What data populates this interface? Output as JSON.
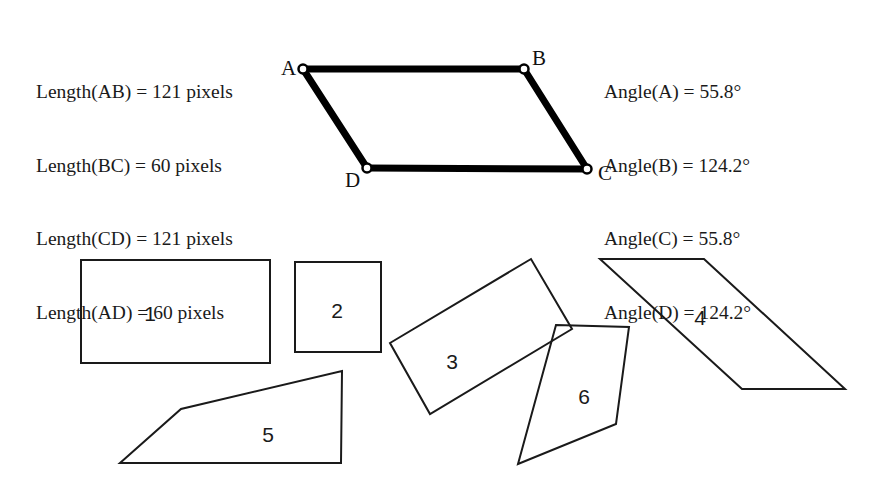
{
  "canvas": {
    "width": 889,
    "height": 497,
    "background": "#ffffff"
  },
  "measurements": {
    "lengths": {
      "lines": [
        "Length(AB) = 121 pixels",
        "Length(BC) = 60 pixels",
        "Length(CD) = 121 pixels",
        "Length(AD) = 60 pixels"
      ]
    },
    "angles": {
      "lines": [
        "Angle(A) = 55.8°",
        "Angle(B) = 124.2°",
        "Angle(C) = 55.8°",
        "Angle(D) = 124.2°"
      ]
    }
  },
  "reference_figure": {
    "name": "parallelogram-ABCD",
    "stroke_color": "#000000",
    "stroke_width": 7,
    "vertex_marker": {
      "fill": "#ffffff",
      "stroke": "#000000",
      "radius": 4.5
    },
    "vertices": [
      {
        "id": "A",
        "x": 303,
        "y": 69,
        "label": "A",
        "label_x": 281,
        "label_y": 58
      },
      {
        "id": "B",
        "x": 524,
        "y": 69,
        "label": "B",
        "label_x": 532,
        "label_y": 48
      },
      {
        "id": "C",
        "x": 587,
        "y": 169,
        "label": "C",
        "label_x": 598,
        "label_y": 163
      },
      {
        "id": "D",
        "x": 367,
        "y": 168,
        "label": "D",
        "label_x": 345,
        "label_y": 170
      }
    ],
    "edges": [
      "A-B",
      "B-C",
      "C-D",
      "D-A"
    ]
  },
  "candidate_shapes": {
    "stroke_color": "#1a1a1a",
    "stroke_width": 2,
    "fill": "none",
    "items": [
      {
        "number": "1",
        "label_x": 150,
        "label_y": 313,
        "points": "81,260 270,260 270,363 81,363"
      },
      {
        "number": "2",
        "label_x": 337,
        "label_y": 310,
        "points": "295,262 381,262 381,352 295,352"
      },
      {
        "number": "3",
        "label_x": 452,
        "label_y": 361,
        "points": "390,343 531,259 572,329 430,414"
      },
      {
        "number": "4",
        "label_x": 700,
        "label_y": 317,
        "points": "600,259 704,259 845,389 742,389"
      },
      {
        "number": "5",
        "label_x": 268,
        "label_y": 434,
        "points": "120,463 181,409 342,371 341,463"
      },
      {
        "number": "6",
        "label_x": 584,
        "label_y": 396,
        "points": "556,325 629,327 616,424 518,464"
      }
    ]
  }
}
